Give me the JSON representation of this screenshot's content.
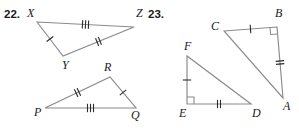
{
  "page": {
    "background_color": "#ffffff",
    "line_color": "#8a8a8a",
    "tick_color": "#2b2b2b",
    "label_color": "#1a1a1a"
  },
  "problems": [
    {
      "number": "22.",
      "figures": [
        {
          "name": "triangle-xyz",
          "vertices": [
            {
              "label": "X",
              "x": 37,
              "y": 22,
              "label_x": 27,
              "label_y": 17
            },
            {
              "label": "Z",
              "x": 134,
              "y": 27,
              "label_x": 136,
              "label_y": 17
            },
            {
              "label": "Y",
              "x": 63,
              "y": 56,
              "label_x": 62,
              "label_y": 69
            }
          ],
          "sides": [
            {
              "from": "X",
              "to": "Z",
              "ticks": 3
            },
            {
              "from": "X",
              "to": "Y",
              "ticks": 1
            },
            {
              "from": "Y",
              "to": "Z",
              "ticks": 2
            }
          ],
          "right_angles": []
        },
        {
          "name": "triangle-pqr",
          "vertices": [
            {
              "label": "P",
              "x": 45,
              "y": 108,
              "label_x": 34,
              "label_y": 116
            },
            {
              "label": "Q",
              "x": 136,
              "y": 108,
              "label_x": 131,
              "label_y": 119
            },
            {
              "label": "R",
              "x": 110,
              "y": 77,
              "label_x": 104,
              "label_y": 71
            }
          ],
          "sides": [
            {
              "from": "P",
              "to": "R",
              "ticks": 2
            },
            {
              "from": "R",
              "to": "Q",
              "ticks": 1
            },
            {
              "from": "P",
              "to": "Q",
              "ticks": 3
            }
          ],
          "right_angles": []
        }
      ]
    },
    {
      "number": "23.",
      "figures": [
        {
          "name": "triangle-abc",
          "vertices": [
            {
              "label": "C",
              "x": 224,
              "y": 31,
              "label_x": 211,
              "label_y": 30
            },
            {
              "label": "B",
              "x": 277,
              "y": 27,
              "label_x": 275,
              "label_y": 17
            },
            {
              "label": "A",
              "x": 283,
              "y": 98,
              "label_x": 283,
              "label_y": 110
            }
          ],
          "sides": [
            {
              "from": "C",
              "to": "B",
              "ticks": 1
            },
            {
              "from": "B",
              "to": "A",
              "ticks": 2
            },
            {
              "from": "C",
              "to": "A",
              "ticks": 0
            }
          ],
          "right_angles": [
            {
              "at": "B",
              "from": "C",
              "to": "A"
            }
          ]
        },
        {
          "name": "triangle-def",
          "vertices": [
            {
              "label": "F",
              "x": 187,
              "y": 56,
              "label_x": 184,
              "label_y": 50
            },
            {
              "label": "E",
              "x": 187,
              "y": 104,
              "label_x": 179,
              "label_y": 117
            },
            {
              "label": "D",
              "x": 251,
              "y": 104,
              "label_x": 252,
              "label_y": 117
            }
          ],
          "sides": [
            {
              "from": "F",
              "to": "E",
              "ticks": 1
            },
            {
              "from": "E",
              "to": "D",
              "ticks": 2
            },
            {
              "from": "F",
              "to": "D",
              "ticks": 0
            }
          ],
          "right_angles": [
            {
              "at": "E",
              "from": "F",
              "to": "D"
            }
          ]
        }
      ]
    }
  ],
  "problem_number_positions": [
    {
      "x": 4,
      "y": 18
    },
    {
      "x": 148,
      "y": 18
    }
  ]
}
